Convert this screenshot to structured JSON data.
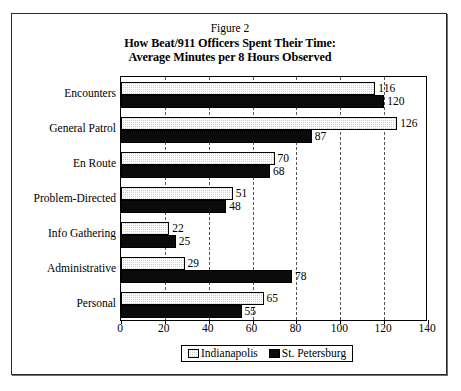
{
  "figure": {
    "number_label": "Figure 2",
    "title_line_1": "How Beat/911 Officers Spent Their Time:",
    "title_line_2": "Average Minutes per 8 Hours Observed"
  },
  "colors": {
    "indianapolis": "#cfcfcf",
    "st_petersburg": "#0b0b0b",
    "axis": "#000000",
    "gridline": "#555555"
  },
  "chart_data": {
    "type": "bar",
    "orientation": "horizontal",
    "title": "How Beat/911 Officers Spent Their Time: Average Minutes per 8 Hours Observed",
    "subtitle": "Figure 2",
    "xlabel": "",
    "ylabel": "",
    "xlim": [
      0,
      140
    ],
    "xticks": [
      0,
      20,
      40,
      60,
      80,
      100,
      120,
      140
    ],
    "grid": true,
    "grid_style": "dashed-vertical",
    "legend_position": "bottom-center",
    "categories": [
      "Encounters",
      "General Patrol",
      "En Route",
      "Problem-Directed",
      "Info Gathering",
      "Administrative",
      "Personal"
    ],
    "series": [
      {
        "name": "Indianapolis",
        "values": [
          116,
          126,
          70,
          51,
          22,
          29,
          65
        ]
      },
      {
        "name": "St. Petersburg",
        "values": [
          120,
          87,
          68,
          48,
          25,
          78,
          55
        ]
      }
    ]
  },
  "legend": {
    "items": [
      {
        "label": "Indianapolis",
        "swatch": "stipple-swatch"
      },
      {
        "label": "St. Petersburg",
        "swatch": "solid-black-swatch"
      }
    ]
  }
}
